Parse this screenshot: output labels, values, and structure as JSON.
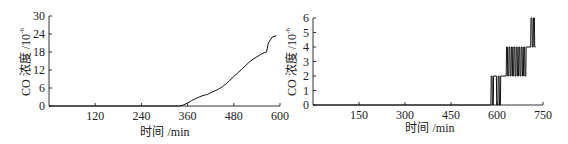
{
  "chart_data": [
    {
      "type": "line",
      "title": "",
      "xlabel": "时间 /min",
      "ylabel": "CO 浓度 /10⁻⁶",
      "xlim": [
        0,
        600
      ],
      "ylim": [
        0,
        30
      ],
      "xticks": [
        120,
        240,
        360,
        480,
        600
      ],
      "yticks": [
        0,
        6,
        12,
        18,
        24,
        30
      ],
      "grid": false,
      "legend": null,
      "series": [
        {
          "name": "CO",
          "x": [
            0,
            340,
            350,
            360,
            370,
            380,
            390,
            400,
            410,
            420,
            430,
            440,
            450,
            460,
            470,
            480,
            490,
            500,
            510,
            520,
            530,
            540,
            550,
            560,
            565,
            570,
            580,
            590
          ],
          "y": [
            0,
            0,
            0.4,
            1.0,
            1.8,
            2.4,
            3.0,
            3.5,
            3.8,
            4.4,
            5.0,
            5.6,
            6.4,
            7.4,
            8.6,
            9.8,
            11.0,
            12.2,
            13.4,
            14.6,
            15.6,
            16.4,
            17.2,
            17.8,
            18.0,
            21.0,
            23.0,
            23.4
          ]
        }
      ]
    },
    {
      "type": "line",
      "title": "",
      "xlabel": "时间 /min",
      "ylabel": "CO 浓度 /10⁻⁶",
      "xlim": [
        0,
        750
      ],
      "ylim": [
        0,
        6
      ],
      "xticks": [
        150,
        300,
        450,
        600,
        750
      ],
      "yticks": [
        0,
        1,
        2,
        3,
        4,
        5,
        6
      ],
      "grid": false,
      "legend": null,
      "series": [
        {
          "name": "CO",
          "x": [
            0,
            580,
            581,
            584,
            585,
            588,
            589,
            598,
            599,
            603,
            604,
            607,
            608,
            611,
            612,
            630,
            631,
            634,
            635,
            638,
            639,
            642,
            643,
            646,
            647,
            650,
            651,
            654,
            655,
            658,
            659,
            662,
            663,
            666,
            667,
            670,
            671,
            674,
            675,
            678,
            679,
            682,
            683,
            686,
            687,
            690,
            691,
            694,
            695,
            710,
            711,
            714,
            715,
            718,
            719,
            722,
            723,
            726
          ],
          "y": [
            0,
            0,
            2,
            2,
            0,
            0,
            2,
            2,
            0,
            0,
            2,
            2,
            0,
            0,
            2,
            2,
            4,
            4,
            2,
            2,
            4,
            4,
            2,
            2,
            4,
            4,
            2,
            2,
            4,
            4,
            2,
            2,
            4,
            4,
            2,
            2,
            4,
            4,
            2,
            2,
            4,
            4,
            2,
            2,
            4,
            4,
            2,
            2,
            4,
            4,
            6,
            6,
            4,
            4,
            6,
            6,
            4,
            4
          ]
        }
      ]
    }
  ],
  "charts": [
    {
      "ylabel_main": "CO 浓度 /10",
      "ylabel_exp": "-6",
      "xlabel": "时间 /min",
      "xtick_labels": [
        "120",
        "240",
        "360",
        "480",
        "600"
      ],
      "ytick_labels": [
        "0",
        "6",
        "12",
        "18",
        "24",
        "30"
      ]
    },
    {
      "ylabel_main": "CO 浓度 /10",
      "ylabel_exp": "-6",
      "xlabel": "时间 /min",
      "xtick_labels": [
        "150",
        "300",
        "450",
        "600",
        "750"
      ],
      "ytick_labels": [
        "0",
        "1",
        "2",
        "3",
        "4",
        "5",
        "6"
      ]
    }
  ]
}
